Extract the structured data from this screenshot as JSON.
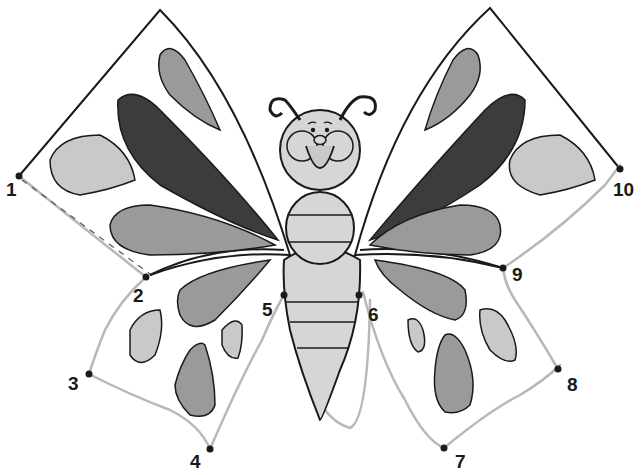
{
  "worksheet": {
    "subject": "butterfly connect-the-dots",
    "colors": {
      "outline": "#1a1a1a",
      "light_fill": "#c9c9c9",
      "mid_fill": "#9a9a9a",
      "dark_fill": "#3c3c3c",
      "body_fill": "#d6d6d6",
      "pencil": "#b8b8b8"
    },
    "dots": [
      {
        "label": "1",
        "x": 19,
        "y": 176,
        "lx": 6,
        "ly": 180
      },
      {
        "label": "2",
        "x": 146,
        "y": 277,
        "lx": 133,
        "ly": 286
      },
      {
        "label": "3",
        "x": 89,
        "y": 374,
        "lx": 68,
        "ly": 374
      },
      {
        "label": "4",
        "x": 210,
        "y": 449,
        "lx": 190,
        "ly": 452
      },
      {
        "label": "5",
        "x": 284,
        "y": 295,
        "lx": 262,
        "ly": 300
      },
      {
        "label": "6",
        "x": 359,
        "y": 295,
        "lx": 368,
        "ly": 305
      },
      {
        "label": "7",
        "x": 444,
        "y": 448,
        "lx": 455,
        "ly": 452
      },
      {
        "label": "8",
        "x": 558,
        "y": 369,
        "lx": 567,
        "ly": 375
      },
      {
        "label": "9",
        "x": 503,
        "y": 268,
        "lx": 512,
        "ly": 265
      },
      {
        "label": "10",
        "x": 620,
        "y": 169,
        "lx": 613,
        "ly": 180
      }
    ]
  }
}
